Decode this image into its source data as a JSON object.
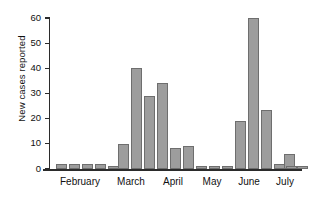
{
  "chart_data": {
    "type": "bar",
    "title": "",
    "subtitle": "",
    "xlabel": "",
    "ylabel": "New cases reported",
    "ylim": [
      0,
      60
    ],
    "yticks": [
      0,
      10,
      20,
      30,
      40,
      50,
      60
    ],
    "ytick_labels": [
      "0",
      "10",
      "20",
      "30",
      "40",
      "50",
      "60"
    ],
    "grid": false,
    "legend": null,
    "bar_color": "#9d9d9d",
    "bar_edge_color": "#6e6e6e",
    "axis_color": "#2b2b2b",
    "categories": [
      "Feb wk1",
      "Feb wk2",
      "Feb wk3",
      "Feb wk4",
      "Mar wk1",
      "Mar wk2",
      "Mar wk3",
      "Mar wk4",
      "Apr wk1",
      "Apr wk2",
      "Apr wk3",
      "Apr wk4",
      "May wk1",
      "May wk2",
      "May wk3",
      "May wk4",
      "Jun wk1",
      "Jun wk2",
      "Jun wk3",
      "Jun wk4",
      "Jul wk1",
      "Jul wk2"
    ],
    "values": [
      2,
      2,
      2,
      2,
      1,
      10,
      40,
      29,
      34,
      8.5,
      9,
      1,
      1,
      1,
      19,
      60,
      23.5,
      2,
      6,
      1,
      1,
      0
    ],
    "x_tick_labels": [
      "February",
      "March",
      "April",
      "May",
      "June",
      "July"
    ],
    "month_label_positions": [
      80,
      131,
      173,
      212,
      249,
      285
    ]
  },
  "axis": {
    "y_label": "New cases reported"
  },
  "months": [
    {
      "label": "February",
      "x": 80
    },
    {
      "label": "March",
      "x": 131
    },
    {
      "label": "April",
      "x": 173
    },
    {
      "label": "May",
      "x": 212
    },
    {
      "label": "June",
      "x": 249
    },
    {
      "label": "July",
      "x": 285
    }
  ],
  "bars": [
    {
      "value": 2,
      "x": 6
    },
    {
      "value": 2,
      "x": 19
    },
    {
      "value": 2,
      "x": 32
    },
    {
      "value": 2,
      "x": 45
    },
    {
      "value": 1,
      "x": 58
    },
    {
      "value": 10,
      "x": 68
    },
    {
      "value": 40,
      "x": 81
    },
    {
      "value": 29,
      "x": 94
    },
    {
      "value": 34,
      "x": 107
    },
    {
      "value": 8.5,
      "x": 120
    },
    {
      "value": 9,
      "x": 133
    },
    {
      "value": 1,
      "x": 146
    },
    {
      "value": 1,
      "x": 159
    },
    {
      "value": 1,
      "x": 172
    },
    {
      "value": 19,
      "x": 185
    },
    {
      "value": 60,
      "x": 198
    },
    {
      "value": 23.5,
      "x": 211
    },
    {
      "value": 2,
      "x": 224
    },
    {
      "value": 6,
      "x": 234
    },
    {
      "value": 1,
      "x": 247
    },
    {
      "value": 1,
      "x": 236
    }
  ]
}
